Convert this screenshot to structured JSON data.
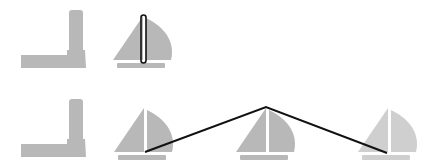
{
  "colors": {
    "background": "#ffffff",
    "shape_gray": "#b5b5b5",
    "shape_gray_light": "#cdcdcd",
    "mast_gap": "#f2f2f2",
    "line": "#111111"
  },
  "rows": [
    {
      "name": "top-row",
      "items": [
        {
          "type": "lighthouse",
          "icon": "lighthouse-icon"
        },
        {
          "type": "sailboat",
          "icon": "sailboat-icon",
          "highlighted_mast": true
        }
      ]
    },
    {
      "name": "bottom-row",
      "items": [
        {
          "type": "lighthouse",
          "icon": "lighthouse-icon"
        },
        {
          "type": "sailboat",
          "icon": "sailboat-icon"
        },
        {
          "type": "sailboat",
          "icon": "sailboat-icon"
        },
        {
          "type": "sailboat",
          "icon": "sailboat-icon",
          "faded": true
        }
      ],
      "polyline": [
        [
          145,
          152
        ],
        [
          266,
          107
        ],
        [
          387,
          153
        ]
      ]
    }
  ]
}
